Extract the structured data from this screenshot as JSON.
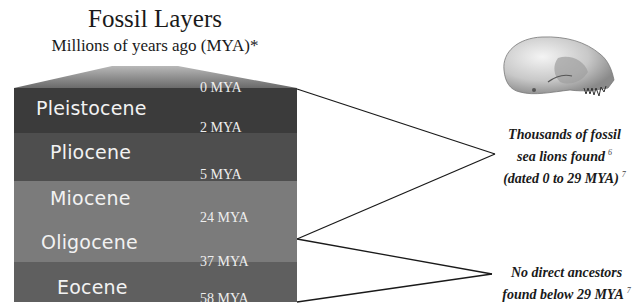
{
  "title": "Fossil Layers",
  "subtitle": "Millions of years ago (MYA)*",
  "colors": {
    "pleistocene": "#3b3b3b",
    "pliocene": "#4e4e4e",
    "miocene": "#7b7b7b",
    "oligocene": "#7b7b7b",
    "eocene": "#5f5f5f",
    "lines": "#1a1a1a"
  },
  "layers": [
    {
      "name": "Pleistocene",
      "top_mya": "0 MYA"
    },
    {
      "name": "Pliocene",
      "top_mya": "2 MYA"
    },
    {
      "name": "Miocene",
      "top_mya": "5 MYA"
    },
    {
      "name": "Oligocene",
      "top_mya": "24 MYA"
    },
    {
      "name": "Eocene",
      "top_mya": "37 MYA",
      "bottom_mya": "58 MYA"
    }
  ],
  "notes": {
    "found": {
      "line1": "Thousands of fossil",
      "line2": "sea lions found",
      "line2_ref": "6",
      "line3": "(dated 0 to 29 MYA)",
      "line3_ref": "7"
    },
    "none": {
      "line1": "No direct ancestors",
      "line2": "found below 29 MYA",
      "line2_ref": "7"
    }
  },
  "image": {
    "icon": "sea-lion-skull-icon"
  }
}
